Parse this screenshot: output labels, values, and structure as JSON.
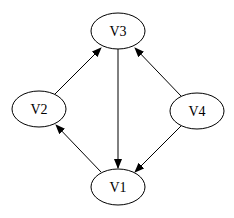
{
  "diagram": {
    "type": "directed-graph",
    "nodes": [
      {
        "id": "V3",
        "label": "V3",
        "cx": 118,
        "cy": 31
      },
      {
        "id": "V2",
        "label": "V2",
        "cx": 39,
        "cy": 109
      },
      {
        "id": "V4",
        "label": "V4",
        "cx": 197,
        "cy": 111
      },
      {
        "id": "V1",
        "label": "V1",
        "cx": 118,
        "cy": 187
      }
    ],
    "edges": [
      {
        "from": "V2",
        "to": "V3"
      },
      {
        "from": "V3",
        "to": "V1"
      },
      {
        "from": "V4",
        "to": "V3"
      },
      {
        "from": "V4",
        "to": "V1"
      },
      {
        "from": "V1",
        "to": "V2"
      }
    ]
  }
}
